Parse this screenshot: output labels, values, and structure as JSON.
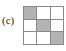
{
  "figure": {
    "panel_label": "(c)",
    "colors": {
      "background": "#ffffff",
      "grid_line": "#8a8a8a",
      "cell_filled": "#b3b3b3",
      "cell_empty": "#ffffff",
      "label_text": "#1a1a1a"
    }
  },
  "chart_data": {
    "type": "heatmap",
    "title": "(c)",
    "xlabel": "",
    "ylabel": "",
    "rows": 3,
    "cols": 3,
    "categories": [
      "col-1",
      "col-2",
      "col-3"
    ],
    "row_labels": [
      "row-1",
      "row-2",
      "row-3"
    ],
    "legend": [],
    "grid": true,
    "values": [
      [
        1,
        0,
        0
      ],
      [
        0,
        1,
        0
      ],
      [
        0,
        0,
        1
      ]
    ],
    "value_colors": {
      "0": "#ffffff",
      "1": "#b3b3b3"
    },
    "pattern": "main-diagonal",
    "filled_count": 3,
    "cells": [
      {
        "row": 0,
        "col": 0,
        "value": 1,
        "state": "filled"
      },
      {
        "row": 0,
        "col": 1,
        "value": 0,
        "state": "empty"
      },
      {
        "row": 0,
        "col": 2,
        "value": 0,
        "state": "empty"
      },
      {
        "row": 1,
        "col": 0,
        "value": 0,
        "state": "empty"
      },
      {
        "row": 1,
        "col": 1,
        "value": 1,
        "state": "filled"
      },
      {
        "row": 1,
        "col": 2,
        "value": 0,
        "state": "empty"
      },
      {
        "row": 2,
        "col": 0,
        "value": 0,
        "state": "empty"
      },
      {
        "row": 2,
        "col": 1,
        "value": 0,
        "state": "empty"
      },
      {
        "row": 2,
        "col": 2,
        "value": 1,
        "state": "filled"
      }
    ]
  }
}
